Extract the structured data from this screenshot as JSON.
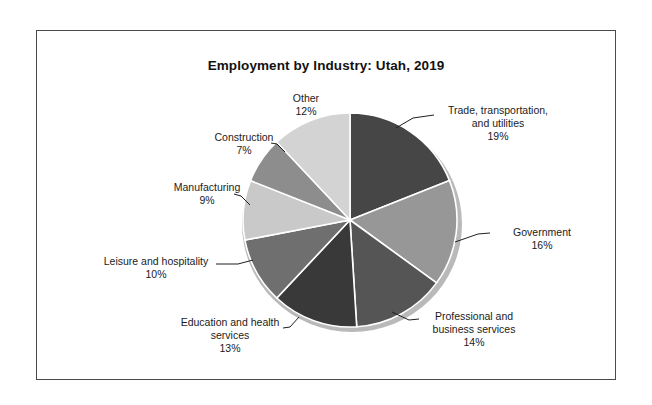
{
  "figure": {
    "title": "Employment by Industry: Utah, 2019",
    "border_color": "#4a4a4a",
    "background": "#ffffff"
  },
  "chart_data": {
    "type": "pie",
    "title": "Employment by Industry: Utah, 2019",
    "xlabel": "",
    "ylabel": "",
    "grid": false,
    "legend": "none",
    "label_format": "name + percent",
    "start_angle_deg": 0,
    "direction": "clockwise",
    "categories": [
      "Trade, transportation, and utilities",
      "Government",
      "Professional and business services",
      "Education and health services",
      "Leisure and hospitality",
      "Manufacturing",
      "Construction",
      "Other"
    ],
    "values": [
      19,
      16,
      14,
      13,
      10,
      9,
      7,
      12
    ],
    "value_labels": [
      "19%",
      "16%",
      "14%",
      "13%",
      "10%",
      "9%",
      "7%",
      "12%"
    ],
    "colors": [
      "#464646",
      "#979797",
      "#555555",
      "#393939",
      "#6f6f6f",
      "#c9c9c9",
      "#8d8d8d",
      "#d3d3d3"
    ],
    "slices": [
      {
        "name": "Trade, transportation, and utilities",
        "label_line1": "Trade, transportation,",
        "label_line2": "and utilities",
        "percent": "19%",
        "value": 19,
        "color": "#464646"
      },
      {
        "name": "Government",
        "label_line1": "Government",
        "label_line2": "",
        "percent": "16%",
        "value": 16,
        "color": "#979797"
      },
      {
        "name": "Professional and business services",
        "label_line1": "Professional and",
        "label_line2": "business services",
        "percent": "14%",
        "value": 14,
        "color": "#555555"
      },
      {
        "name": "Education and health services",
        "label_line1": "Education and health",
        "label_line2": "services",
        "percent": "13%",
        "value": 13,
        "color": "#393939"
      },
      {
        "name": "Leisure and hospitality",
        "label_line1": "Leisure and hospitality",
        "label_line2": "",
        "percent": "10%",
        "value": 10,
        "color": "#6f6f6f"
      },
      {
        "name": "Manufacturing",
        "label_line1": "Manufacturing",
        "label_line2": "",
        "percent": "9%",
        "value": 9,
        "color": "#c9c9c9"
      },
      {
        "name": "Construction",
        "label_line1": "Construction",
        "label_line2": "",
        "percent": "7%",
        "value": 7,
        "color": "#8d8d8d"
      },
      {
        "name": "Other",
        "label_line1": "Other",
        "label_line2": "",
        "percent": "12%",
        "value": 12,
        "color": "#d3d3d3"
      }
    ]
  }
}
